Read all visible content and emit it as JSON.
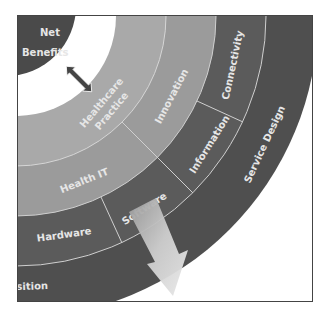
{
  "diagram": {
    "center": {
      "label_line1": "Net",
      "label_line2": "Benefits",
      "color": "#4a4a4a"
    },
    "rings": [
      {
        "name": "inner",
        "color": "#a9a9a9",
        "segments": [
          {
            "label_line1": "Healthcare",
            "label_line2": "Practice"
          }
        ]
      },
      {
        "name": "middle",
        "color": "#9b9b9b",
        "segments": [
          {
            "label": "Innovation"
          },
          {
            "label": "Health IT"
          }
        ]
      },
      {
        "name": "technology",
        "color": "#5b5b5b",
        "segments": [
          {
            "label": "Connectivity"
          },
          {
            "label": "Information"
          },
          {
            "label": "Software"
          },
          {
            "label": "Hardware"
          }
        ]
      },
      {
        "name": "outer",
        "color": "#4f4f4f",
        "segments": [
          {
            "label": "Service Design"
          },
          {
            "label": "Transition"
          }
        ]
      }
    ],
    "connector": {
      "icon": "double-arrow-icon",
      "color": "#444444"
    },
    "pointer": {
      "icon": "down-right-arrow-icon",
      "color": "#c8c8c8"
    }
  }
}
